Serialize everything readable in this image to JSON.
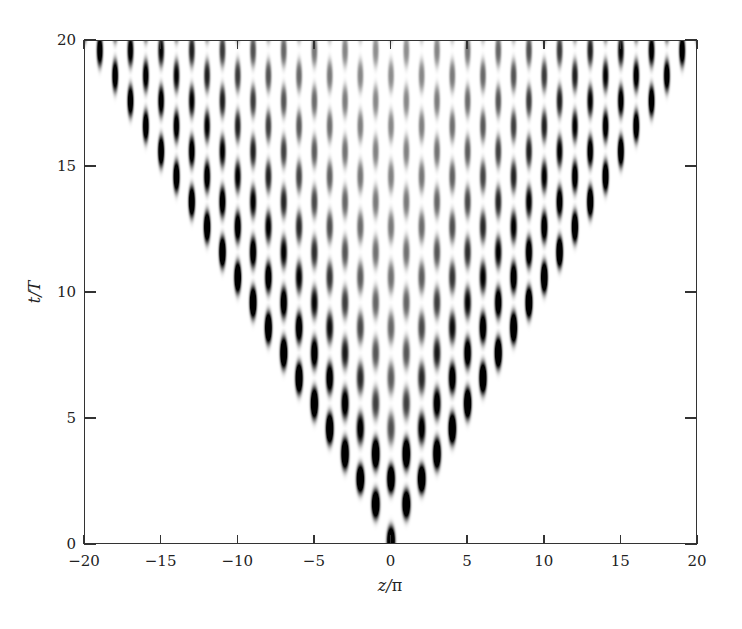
{
  "chart_data": {
    "type": "heatmap",
    "title": "",
    "xlabel": "z/π",
    "ylabel": "t/T",
    "xlim": [
      -20,
      20
    ],
    "ylim": [
      0,
      20
    ],
    "x_ticks": [
      -20,
      -15,
      -10,
      -5,
      0,
      5,
      10,
      15,
      20
    ],
    "x_tick_labels": [
      "−20",
      "−15",
      "−10",
      "−5",
      "0",
      "5",
      "10",
      "15",
      "20"
    ],
    "y_ticks": [
      0,
      5,
      10,
      15,
      20
    ],
    "y_tick_labels": [
      "0",
      "5",
      "10",
      "15",
      "20"
    ],
    "grid": false,
    "legend": null,
    "colormap": "grayscale (white = 0, black = max intensity)",
    "lattice": {
      "z_spacing": 2,
      "t_spacing": 1,
      "row_offset": 1,
      "front_slope": 1,
      "lobe_half_width_z": 0.28,
      "lobe_half_height_t": 0.55
    },
    "colors": {
      "ink": "#000000",
      "background": "#ffffff",
      "axis": "#333333"
    }
  }
}
